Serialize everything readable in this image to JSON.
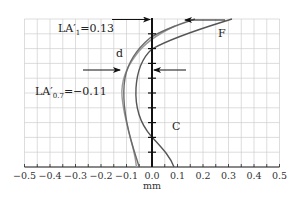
{
  "chart_data": {
    "type": "line",
    "title": "",
    "xlabel": "mm",
    "ylabel": "",
    "xlim": [
      -0.5,
      0.5
    ],
    "x_ticks": [
      "−0.5",
      "−0.4",
      "−0.3",
      "−0.2",
      "−0.1",
      "0.0",
      "0.1",
      "0.2",
      "0.3",
      "0.4",
      "0.5"
    ],
    "grid": true,
    "annotations": [
      {
        "id": "la1",
        "text": "LA′",
        "sub": "1",
        "value": "=0.13"
      },
      {
        "id": "la07",
        "text": "LA′",
        "sub": "0.7",
        "value": "=−0.11"
      },
      {
        "id": "label_d",
        "text": "d"
      },
      {
        "id": "label_F",
        "text": "F"
      },
      {
        "id": "label_C",
        "text": "C"
      }
    ],
    "series": [
      {
        "name": "F / C",
        "color": "#555555",
        "points": [
          [
            0.31,
            1.0
          ],
          [
            0.14,
            0.93
          ],
          [
            0.0,
            0.8
          ],
          [
            -0.05,
            0.63
          ],
          [
            -0.065,
            0.45
          ],
          [
            -0.03,
            0.25
          ],
          [
            0.05,
            0.12
          ],
          [
            0.09,
            0.0
          ]
        ]
      },
      {
        "name": "curve-2",
        "color": "#666666",
        "points": [
          [
            0.17,
            1.0
          ],
          [
            0.0,
            0.89
          ],
          [
            -0.08,
            0.72
          ],
          [
            -0.11,
            0.55
          ],
          [
            -0.095,
            0.32
          ],
          [
            -0.06,
            0.12
          ],
          [
            -0.05,
            0.0
          ]
        ]
      },
      {
        "name": "d",
        "color": "#999999",
        "points": [
          [
            0.09,
            0.96
          ],
          [
            -0.045,
            0.82
          ],
          [
            -0.11,
            0.65
          ],
          [
            -0.118,
            0.52
          ],
          [
            -0.095,
            0.32
          ],
          [
            -0.07,
            0.12
          ],
          [
            -0.06,
            0.0
          ]
        ]
      }
    ],
    "arrows": [
      {
        "name": "top-left-arrow",
        "from": [
          -0.25,
          1.0
        ],
        "to": [
          0.0,
          1.0
        ]
      },
      {
        "name": "top-right-arrow",
        "from": [
          0.29,
          0.995
        ],
        "to": [
          0.13,
          0.995
        ]
      },
      {
        "name": "mid-left-arrow",
        "from": [
          -0.27,
          0.69
        ],
        "to": [
          -0.16,
          0.69
        ]
      },
      {
        "name": "mid-right-arrow",
        "from": [
          0.09,
          0.69
        ],
        "to": [
          0.0,
          0.69
        ]
      }
    ]
  },
  "labels": {
    "la1_main": "LA′",
    "la1_sub": "1",
    "la1_val": "=0.13",
    "la07_main": "LA′",
    "la07_sub": "0.7",
    "la07_val": "=−0.11",
    "d": "d",
    "F": "F",
    "C": "C",
    "xlabel": "mm",
    "ticks": [
      "−0.5",
      "−0.4",
      "−0.3",
      "−0.2",
      "−0.1",
      "0.0",
      "0.1",
      "0.2",
      "0.3",
      "0.4",
      "0.5"
    ]
  }
}
